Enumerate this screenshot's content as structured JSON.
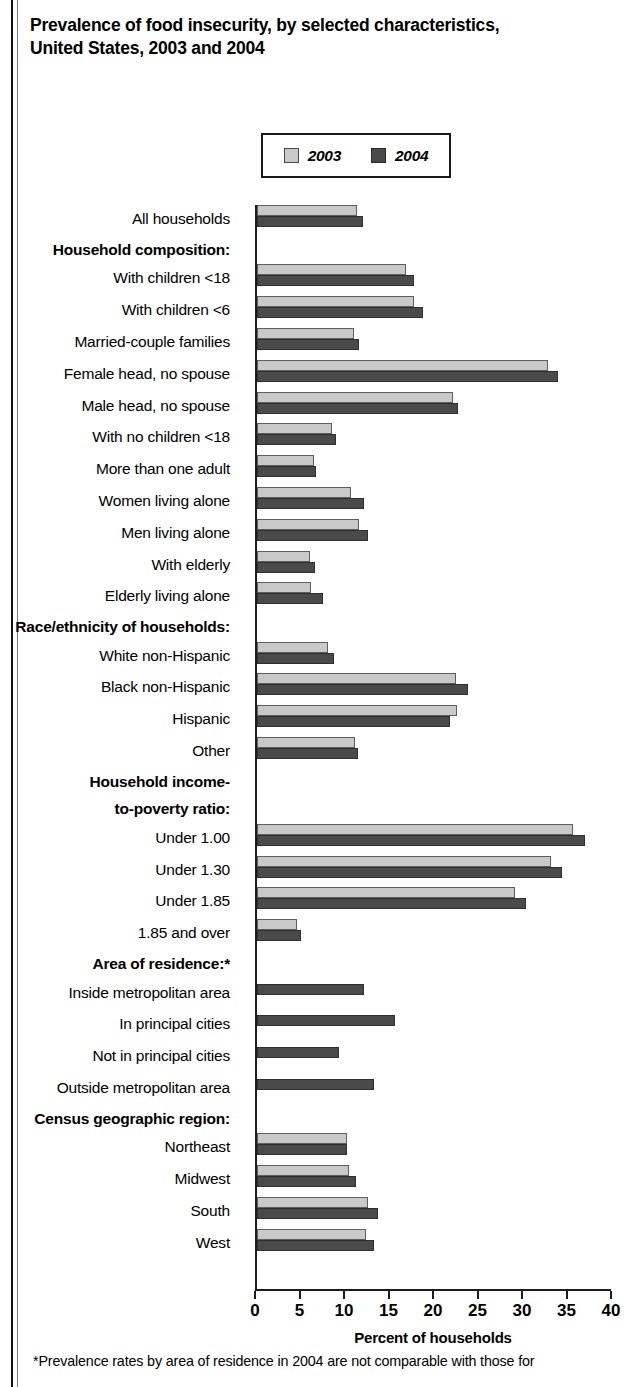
{
  "title": {
    "line1": "Prevalence of food insecurity, by selected characteristics,",
    "line2": "United States, 2003 and 2004"
  },
  "legend": {
    "items": [
      {
        "label": "2003",
        "color": "#c9c9c9"
      },
      {
        "label": "2004",
        "color": "#4a4a4a"
      }
    ]
  },
  "footnote": "*Prevalence rates by area of residence in 2004 are not comparable with those for",
  "chart_data": {
    "type": "bar",
    "orientation": "horizontal",
    "title": "Prevalence of food insecurity, by selected characteristics, United States, 2003 and 2004",
    "xlabel": "Percent of households",
    "ylabel": "",
    "xlim": [
      0,
      40
    ],
    "xticks": [
      0,
      5,
      10,
      15,
      20,
      25,
      30,
      35,
      40
    ],
    "grid": false,
    "legend_position": "top",
    "categories": [
      "All households",
      "Household composition:",
      "With children <18",
      "With children <6",
      "Married-couple families",
      "Female head, no spouse",
      "Male head, no spouse",
      "With no children <18",
      "More than one adult",
      "Women living alone",
      "Men living alone",
      "With elderly",
      "Elderly living alone",
      "Race/ethnicity of households:",
      "White non-Hispanic",
      "Black non-Hispanic",
      "Hispanic",
      "Other",
      "Household income-",
      "to-poverty ratio:",
      "Under 1.00",
      "Under 1.30",
      "Under 1.85",
      "1.85 and over",
      "Area of residence:*",
      "Inside metropolitan area",
      "In principal cities",
      "Not in principal cities",
      "Outside metropolitan area",
      "Census geographic region:",
      "Northeast",
      "Midwest",
      "South",
      "West"
    ],
    "header_categories": [
      "Household composition:",
      "Race/ethnicity of households:",
      "Household income-",
      "to-poverty ratio:",
      "Area of residence:*",
      "Census geographic region:"
    ],
    "series": [
      {
        "name": "2003",
        "color": "#c9c9c9",
        "values": [
          11.2,
          null,
          16.7,
          17.6,
          10.9,
          32.7,
          22.0,
          8.4,
          6.4,
          10.6,
          11.5,
          5.9,
          6.1,
          null,
          8.0,
          22.4,
          22.5,
          11.0,
          null,
          null,
          35.5,
          33.0,
          29.0,
          4.5,
          null,
          null,
          null,
          null,
          null,
          null,
          10.1,
          10.3,
          12.5,
          12.2
        ]
      },
      {
        "name": "2004",
        "color": "#4a4a4a",
        "values": [
          11.9,
          null,
          17.6,
          18.6,
          11.5,
          33.8,
          22.6,
          8.9,
          6.6,
          12.0,
          12.5,
          6.5,
          7.4,
          null,
          8.6,
          23.7,
          21.7,
          11.3,
          null,
          null,
          36.8,
          34.3,
          30.2,
          4.9,
          null,
          12.0,
          15.5,
          9.2,
          13.2,
          null,
          10.1,
          11.1,
          13.6,
          13.1
        ]
      }
    ]
  }
}
